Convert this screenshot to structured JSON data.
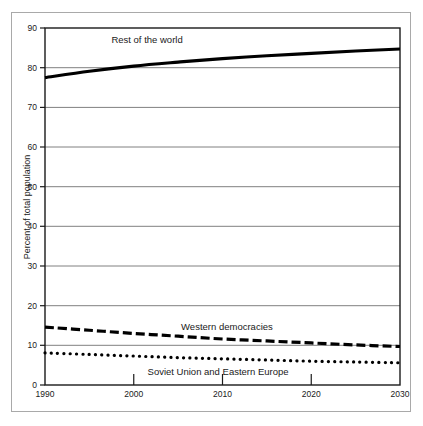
{
  "chart_data": {
    "type": "line",
    "title": "",
    "subtitle": "",
    "xlabel": "",
    "ylabel": "Percent of total population",
    "xlim": [
      1990,
      2030
    ],
    "ylim": [
      0,
      90
    ],
    "grid": true,
    "grid_axis": "y",
    "legend_position": "inline-annotations",
    "x": [
      1990,
      1995,
      2000,
      2005,
      2010,
      2015,
      2020,
      2025,
      2030
    ],
    "xticks": [
      "1990",
      "2000",
      "2010",
      "2020",
      "2030"
    ],
    "yticks": [
      "0",
      "10",
      "20",
      "30",
      "40",
      "50",
      "60",
      "70",
      "80",
      "90"
    ],
    "series": [
      {
        "name": "Rest of the world",
        "style": "solid",
        "color": "#000000",
        "width": 3.2,
        "values": [
          77.5,
          79.1,
          80.4,
          81.4,
          82.3,
          83.0,
          83.6,
          84.2,
          84.7
        ]
      },
      {
        "name": "Western democracies",
        "style": "dashed",
        "color": "#000000",
        "width": 3.2,
        "values": [
          14.6,
          13.8,
          13.0,
          12.3,
          11.6,
          11.1,
          10.6,
          10.1,
          9.7
        ]
      },
      {
        "name": "Soviet Union and Eastern Europe",
        "style": "dotted",
        "color": "#000000",
        "width": 3.2,
        "values": [
          8.1,
          7.7,
          7.3,
          6.9,
          6.6,
          6.3,
          6.0,
          5.8,
          5.6
        ]
      }
    ],
    "annotations": [
      {
        "text": "Rest of the world",
        "x": 2001.5,
        "y": 86.2
      },
      {
        "text": "Western democracies",
        "x": 2010.5,
        "y": 13.9
      },
      {
        "text": "Soviet Union and Eastern Europe",
        "x": 2009.5,
        "y": 2.6
      }
    ]
  },
  "colors": {
    "line": "#000000",
    "grid": "#808080",
    "frame": "#1a1a1a",
    "outer_border": "#a9a9a9",
    "background": "#ffffff",
    "text": "#1a1a1a"
  }
}
